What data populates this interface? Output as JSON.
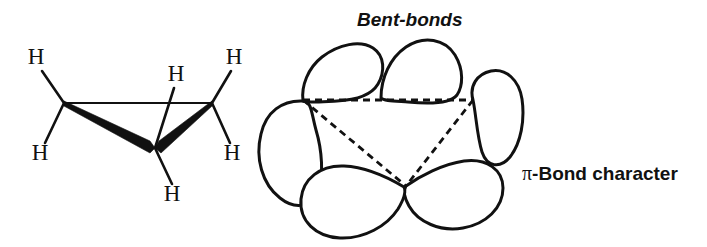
{
  "figure": {
    "width": 707,
    "height": 247,
    "background_color": "#ffffff",
    "ink_color": "#111111"
  },
  "labels": {
    "bent_bonds": "Bent-bonds",
    "pi_symbol": "π",
    "pi_bond_character": "-Bond character"
  },
  "left_structure": {
    "name": "cyclopropane-perspective-structure",
    "hydrogens": [
      {
        "id": "h-upper-left",
        "text": "H",
        "x": 36,
        "y": 64
      },
      {
        "id": "h-lower-left",
        "text": "H",
        "x": 40,
        "y": 160
      },
      {
        "id": "h-upper-center",
        "text": "H",
        "x": 176,
        "y": 81
      },
      {
        "id": "h-upper-right",
        "text": "H",
        "x": 234,
        "y": 64
      },
      {
        "id": "h-lower-right",
        "text": "H",
        "x": 232,
        "y": 160
      },
      {
        "id": "h-bottom-front",
        "text": "H",
        "x": 172,
        "y": 201
      }
    ],
    "carbons": [
      {
        "id": "c-left",
        "x": 64,
        "y": 103
      },
      {
        "id": "c-right",
        "x": 212,
        "y": 103
      },
      {
        "id": "c-front",
        "x": 155,
        "y": 148
      }
    ],
    "ring_bonds": [
      {
        "id": "bond-back",
        "type": "plain",
        "from": "c-left",
        "to": "c-right"
      },
      {
        "id": "bond-left-front",
        "type": "wedge",
        "from": "c-front",
        "to": "c-left"
      },
      {
        "id": "bond-right-front",
        "type": "wedge",
        "from": "c-front",
        "to": "c-right"
      }
    ],
    "ch_bonds": [
      {
        "id": "ch-upper-left",
        "from": "c-left",
        "to": "h-upper-left"
      },
      {
        "id": "ch-lower-left",
        "from": "c-left",
        "to": "h-lower-left"
      },
      {
        "id": "ch-upper-right",
        "from": "c-right",
        "to": "h-upper-right"
      },
      {
        "id": "ch-lower-right",
        "from": "c-right",
        "to": "h-lower-right"
      },
      {
        "id": "ch-upper-center",
        "from": "c-front",
        "to": "h-upper-center"
      },
      {
        "id": "ch-bottom-front",
        "from": "c-front",
        "to": "h-bottom-front"
      }
    ]
  },
  "right_structure": {
    "name": "bent-bond-orbital-diagram",
    "lobe_count": 6,
    "triangle_vertices": [
      {
        "id": "v-top-left",
        "x": 303,
        "y": 100
      },
      {
        "id": "v-top-right",
        "x": 473,
        "y": 100
      },
      {
        "id": "v-bottom",
        "x": 406,
        "y": 186
      }
    ],
    "triangle_edges": [
      {
        "id": "edge-top",
        "from": "v-top-left",
        "to": "v-top-right",
        "style": "dashed"
      },
      {
        "id": "edge-left-bottom",
        "from": "v-top-left",
        "to": "v-bottom",
        "style": "dashed"
      },
      {
        "id": "edge-right",
        "from": "v-top-right",
        "to": "v-bottom",
        "style": "dashed"
      }
    ],
    "lobes": [
      {
        "id": "lobe-top-left",
        "position": "top-left"
      },
      {
        "id": "lobe-top-right",
        "position": "top-right"
      },
      {
        "id": "lobe-right-upper",
        "position": "right-upper"
      },
      {
        "id": "lobe-right-lower",
        "position": "right-lower"
      },
      {
        "id": "lobe-bottom",
        "position": "bottom"
      },
      {
        "id": "lobe-left",
        "position": "left"
      }
    ]
  },
  "caption_positions": {
    "bent_bonds": {
      "x": 357,
      "y": 26
    },
    "pi_bond_character": {
      "x": 522,
      "y": 180
    }
  }
}
